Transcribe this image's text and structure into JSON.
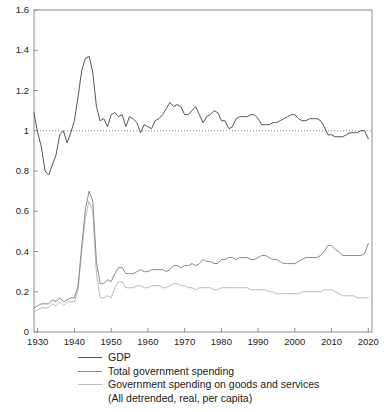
{
  "chart_data": {
    "type": "line",
    "title": "",
    "xlabel": "",
    "ylabel": "",
    "xlim": [
      1929,
      2021
    ],
    "ylim": [
      0,
      1.6
    ],
    "yticks": [
      "0",
      "0.2",
      "0.4",
      "0.6",
      "0.8",
      "1",
      "1.2",
      "1.4",
      "1.6"
    ],
    "ytick_values": [
      0,
      0.2,
      0.4,
      0.6,
      0.8,
      1.0,
      1.2,
      1.4,
      1.6
    ],
    "xticks": [
      "1930",
      "1940",
      "1950",
      "1960",
      "1970",
      "1980",
      "1990",
      "2000",
      "2010",
      "2020"
    ],
    "xtick_values": [
      1930,
      1940,
      1950,
      1960,
      1970,
      1980,
      1990,
      2000,
      2010,
      2020
    ],
    "grid": false,
    "legend_position": "below",
    "reference_line": {
      "y": 1.0,
      "style": "dotted",
      "color": "#888888"
    },
    "colors": {
      "gdp": "#555555",
      "total_spending": "#8a8a8a",
      "goods_services": "#bbbbbb"
    },
    "note": "(All detrended, real, per capita)",
    "x": [
      1929,
      1930,
      1931,
      1932,
      1933,
      1934,
      1935,
      1936,
      1937,
      1938,
      1939,
      1940,
      1941,
      1942,
      1943,
      1944,
      1945,
      1946,
      1947,
      1948,
      1949,
      1950,
      1951,
      1952,
      1953,
      1954,
      1955,
      1956,
      1957,
      1958,
      1959,
      1960,
      1961,
      1962,
      1963,
      1964,
      1965,
      1966,
      1967,
      1968,
      1969,
      1970,
      1971,
      1972,
      1973,
      1974,
      1975,
      1976,
      1977,
      1978,
      1979,
      1980,
      1981,
      1982,
      1983,
      1984,
      1985,
      1986,
      1987,
      1988,
      1989,
      1990,
      1991,
      1992,
      1993,
      1994,
      1995,
      1996,
      1997,
      1998,
      1999,
      2000,
      2001,
      2002,
      2003,
      2004,
      2005,
      2006,
      2007,
      2008,
      2009,
      2010,
      2011,
      2012,
      2013,
      2014,
      2015,
      2016,
      2017,
      2018,
      2019,
      2020
    ],
    "series": [
      {
        "name": "GDP",
        "color": "#555555",
        "values": [
          1.09,
          0.99,
          0.92,
          0.8,
          0.78,
          0.83,
          0.88,
          0.98,
          1.0,
          0.94,
          0.99,
          1.05,
          1.17,
          1.3,
          1.36,
          1.37,
          1.29,
          1.12,
          1.05,
          1.06,
          1.02,
          1.08,
          1.09,
          1.07,
          1.08,
          1.02,
          1.07,
          1.06,
          1.04,
          0.99,
          1.03,
          1.02,
          1.01,
          1.05,
          1.06,
          1.08,
          1.11,
          1.14,
          1.12,
          1.13,
          1.12,
          1.08,
          1.08,
          1.1,
          1.12,
          1.08,
          1.04,
          1.07,
          1.08,
          1.1,
          1.09,
          1.05,
          1.05,
          1.01,
          1.02,
          1.06,
          1.07,
          1.07,
          1.07,
          1.08,
          1.08,
          1.06,
          1.03,
          1.03,
          1.03,
          1.04,
          1.04,
          1.05,
          1.06,
          1.07,
          1.08,
          1.08,
          1.06,
          1.05,
          1.05,
          1.06,
          1.06,
          1.06,
          1.05,
          1.02,
          0.98,
          0.98,
          0.97,
          0.97,
          0.97,
          0.98,
          0.99,
          0.99,
          0.99,
          1.0,
          1.0,
          0.96
        ]
      },
      {
        "name": "Total government spending",
        "color": "#8a8a8a",
        "values": [
          0.12,
          0.13,
          0.14,
          0.14,
          0.14,
          0.16,
          0.15,
          0.17,
          0.15,
          0.16,
          0.17,
          0.17,
          0.23,
          0.43,
          0.61,
          0.7,
          0.65,
          0.35,
          0.24,
          0.24,
          0.26,
          0.25,
          0.29,
          0.32,
          0.32,
          0.29,
          0.29,
          0.29,
          0.3,
          0.31,
          0.3,
          0.3,
          0.31,
          0.31,
          0.31,
          0.31,
          0.3,
          0.31,
          0.33,
          0.33,
          0.32,
          0.33,
          0.33,
          0.34,
          0.33,
          0.34,
          0.36,
          0.35,
          0.35,
          0.34,
          0.34,
          0.36,
          0.36,
          0.37,
          0.37,
          0.36,
          0.37,
          0.37,
          0.37,
          0.36,
          0.36,
          0.37,
          0.38,
          0.38,
          0.37,
          0.36,
          0.36,
          0.35,
          0.34,
          0.34,
          0.34,
          0.34,
          0.35,
          0.36,
          0.37,
          0.37,
          0.37,
          0.37,
          0.38,
          0.4,
          0.43,
          0.43,
          0.41,
          0.4,
          0.38,
          0.38,
          0.38,
          0.38,
          0.38,
          0.38,
          0.39,
          0.44
        ]
      },
      {
        "name": "Government spending on goods and services",
        "color": "#bbbbbb",
        "values": [
          0.1,
          0.11,
          0.12,
          0.12,
          0.12,
          0.14,
          0.13,
          0.15,
          0.13,
          0.15,
          0.15,
          0.15,
          0.21,
          0.4,
          0.57,
          0.65,
          0.6,
          0.29,
          0.17,
          0.17,
          0.18,
          0.17,
          0.22,
          0.25,
          0.25,
          0.22,
          0.22,
          0.22,
          0.23,
          0.23,
          0.22,
          0.22,
          0.23,
          0.23,
          0.23,
          0.22,
          0.22,
          0.23,
          0.24,
          0.24,
          0.23,
          0.23,
          0.22,
          0.22,
          0.21,
          0.22,
          0.22,
          0.22,
          0.22,
          0.21,
          0.21,
          0.22,
          0.22,
          0.22,
          0.22,
          0.22,
          0.22,
          0.22,
          0.22,
          0.21,
          0.21,
          0.21,
          0.21,
          0.21,
          0.2,
          0.2,
          0.19,
          0.19,
          0.19,
          0.19,
          0.19,
          0.19,
          0.19,
          0.2,
          0.2,
          0.2,
          0.2,
          0.2,
          0.2,
          0.21,
          0.21,
          0.21,
          0.2,
          0.19,
          0.18,
          0.18,
          0.18,
          0.18,
          0.17,
          0.17,
          0.17,
          0.17
        ]
      }
    ]
  },
  "legend": {
    "items": [
      {
        "label": "GDP"
      },
      {
        "label": "Total government spending"
      },
      {
        "label": "Government spending on goods and services"
      }
    ],
    "note": "(All detrended, real, per capita)"
  }
}
